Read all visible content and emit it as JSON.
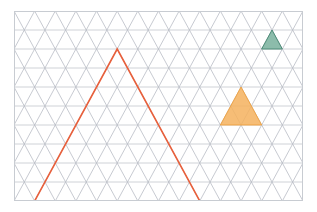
{
  "figure": {
    "width": 317,
    "height": 212,
    "background_color": "#ffffff",
    "plot_area": {
      "x": 14,
      "y": 11,
      "width": 289,
      "height": 190,
      "border_color": "#c8ccd2",
      "border_width": 1,
      "fill_color": "#ffffff"
    }
  },
  "chart_data": {
    "type": "diagram",
    "title": "",
    "subtitle": "",
    "xlabel": "",
    "ylabel": "",
    "grid": true,
    "legend": false,
    "legend_position": "none",
    "axis_visible": false,
    "tick_labels_x": [],
    "tick_labels_y": [],
    "xlim": [
      0,
      14
    ],
    "ylim": [
      0,
      10
    ],
    "lattice": {
      "kind": "triangular",
      "description": "Isometric triangular lattice of equilateral triangles",
      "cell_base_px": 20.64,
      "cell_height_px": 19.0,
      "columns": 14,
      "rows": 10,
      "line_color": "#b9bdc5",
      "line_color_horizontal": "#c3c7cd",
      "line_width": 0.8
    },
    "shapes": [
      {
        "name": "large-outlined-triangle",
        "role": "target-outline",
        "units_per_side": 8,
        "fill": "none",
        "fill_opacity": 0,
        "stroke": "#e8603c",
        "stroke_width": 1.6,
        "vertices_units": [
          [
            1,
            0
          ],
          [
            9,
            0
          ],
          [
            5,
            8
          ]
        ],
        "vertices_px": [
          [
            34.6,
            182.0
          ],
          [
            199.8,
            182.0
          ],
          [
            117.2,
            30.0
          ]
        ]
      },
      {
        "name": "orange-filled-triangle",
        "role": "filled-region",
        "units_per_side": 2,
        "fill": "#f5b25e",
        "fill_opacity": 0.85,
        "stroke": "#f0a13f",
        "stroke_width": 0.9,
        "vertices_units": [
          [
            10,
            4
          ],
          [
            12,
            4
          ],
          [
            11,
            6
          ]
        ],
        "vertices_px": [
          [
            220.4,
            125.0
          ],
          [
            261.7,
            125.0
          ],
          [
            241.0,
            87.0
          ]
        ]
      },
      {
        "name": "green-filled-triangle",
        "role": "filled-region",
        "units_per_side": 1,
        "fill": "#7fb5a2",
        "fill_opacity": 0.9,
        "stroke": "#4e8c78",
        "stroke_width": 1.0,
        "vertices_units": [
          [
            12,
            8
          ],
          [
            13,
            8
          ],
          [
            12.5,
            9
          ]
        ],
        "vertices_px": [
          [
            261.7,
            49.0
          ],
          [
            282.3,
            49.0
          ],
          [
            272.0,
            30.0
          ]
        ]
      }
    ]
  }
}
